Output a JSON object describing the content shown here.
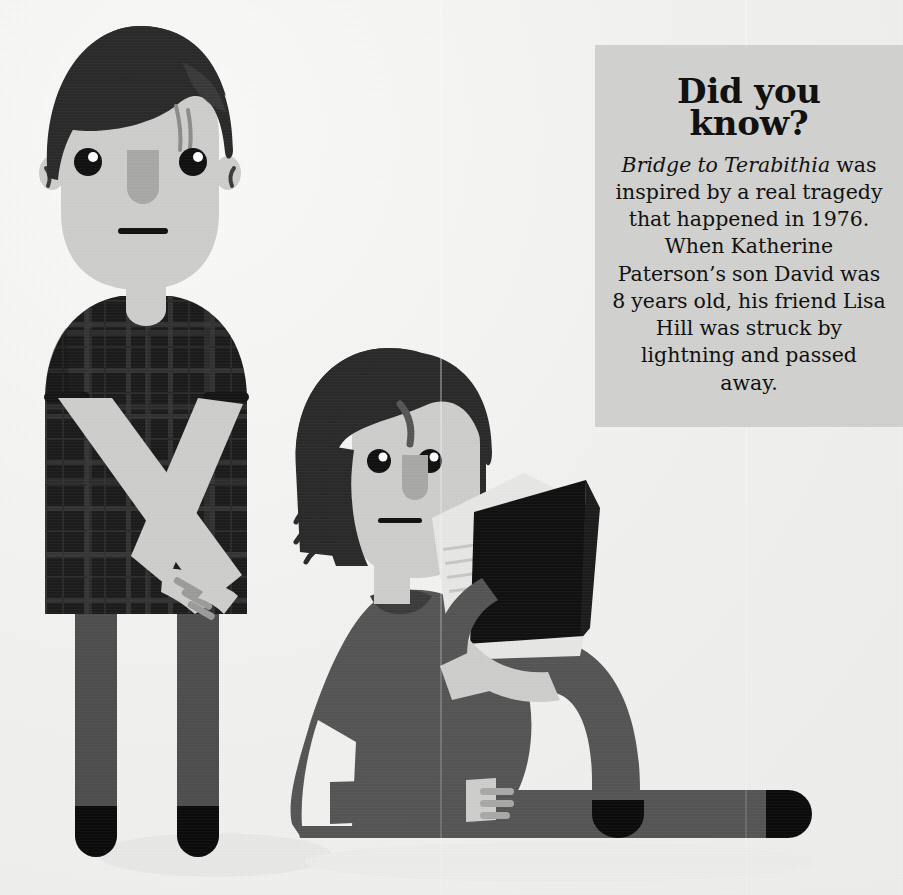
{
  "page": {
    "width": 903,
    "height": 895,
    "background_color": "#f2f2f0"
  },
  "fact_box": {
    "background_color": "#d2d2d0",
    "text_color": "#111111",
    "heading_line_1": "Did you",
    "heading_line_2": "know?",
    "book_title": "Bridge to Terabithia",
    "body_rest": " was inspired by a real tragedy that happened in 1976. When Katherine Paterson’s son David was 8 years old, his friend Lisa Hill was struck by lightning and passed away.",
    "body_full": "Bridge to Terabithia was inspired by a real tragedy that happened in 1976. When Katherine Paterson’s son David was 8 years old, his friend Lisa Hill was struck by lightning and passed away."
  },
  "illustration": {
    "palette": {
      "hair_black": "#2b2b2b",
      "skin_light": "#cfd0cd",
      "skin_shadow": "#a9aaa7",
      "shirt_dark": "#202020",
      "shirt_plaid_line": "#3a3a3a",
      "pants_gray": "#4f4f4f",
      "sweater_gray": "#565656",
      "shoe_black": "#0c0c0c",
      "book_cover_black": "#111111",
      "book_page_white": "#e8e8e6",
      "eye_black": "#111111",
      "eye_highlight": "#ffffff",
      "shadow_gray": "#e6e6e4"
    },
    "figures": [
      {
        "name": "standing-boy",
        "pose": "standing, arms crossed in front of body",
        "hair": "short dark bowl cut with fringe",
        "top": "dark plaid short-sleeve t-shirt",
        "bottom": "grey trousers",
        "shoes": "black rounded shoes"
      },
      {
        "name": "sitting-girl",
        "pose": "sitting on ground, legs extended right with one knee bent, holding an open book",
        "hair": "dark chin-length bob with wispy strands",
        "top": "grey long-sleeve sweater",
        "bottom": "grey trousers",
        "shoes": "black rounded shoes",
        "holding": "open black hardcover book"
      }
    ]
  }
}
